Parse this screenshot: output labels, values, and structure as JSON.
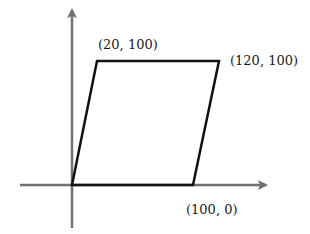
{
  "diagram": {
    "type": "coordinate-parallelogram",
    "axes": {
      "color": "#707070",
      "x_axis": {
        "from": [
          20,
          185
        ],
        "to": [
          268,
          185
        ]
      },
      "y_axis": {
        "from": [
          72,
          228
        ],
        "to": [
          72,
          8
        ]
      }
    },
    "shape": {
      "stroke": "#111111",
      "points": [
        [
          72,
          185
        ],
        [
          97,
          61
        ],
        [
          219,
          61
        ],
        [
          193,
          185
        ]
      ]
    },
    "labels": [
      {
        "id": "top-left",
        "text": "(20, 100)",
        "x": 98,
        "y": 38
      },
      {
        "id": "top-right",
        "text": "(120, 100)",
        "x": 230,
        "y": 54
      },
      {
        "id": "bottom-right",
        "text": "(100, 0)",
        "x": 186,
        "y": 202
      }
    ]
  }
}
